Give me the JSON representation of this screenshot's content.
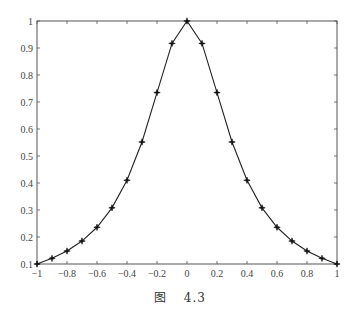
{
  "chart_data": {
    "type": "line",
    "title": "",
    "xlabel": "",
    "ylabel": "",
    "xlim": [
      -1,
      1
    ],
    "ylim": [
      0.1,
      1
    ],
    "grid": false,
    "legend": null,
    "marker": "star",
    "line_color": "#222222",
    "x_ticks": [
      -1,
      -0.8,
      -0.6,
      -0.4,
      -0.2,
      0,
      0.2,
      0.4,
      0.6,
      0.8,
      1
    ],
    "x_tick_labels": [
      "−1",
      "−0.8",
      "−0.6",
      "−0.4",
      "−0.2",
      "0",
      "0.2",
      "0.4",
      "0.6",
      "0.8",
      "1"
    ],
    "y_ticks": [
      0.1,
      0.2,
      0.3,
      0.4,
      0.5,
      0.6,
      0.7,
      0.8,
      0.9,
      1
    ],
    "y_tick_labels": [
      "0.1",
      "0.2",
      "0.3",
      "0.4",
      "0.5",
      "0.6",
      "0.7",
      "0.8",
      "0.9",
      "1"
    ],
    "series": [
      {
        "name": "f(x)",
        "x": [
          -1,
          -0.9,
          -0.8,
          -0.7,
          -0.6,
          -0.5,
          -0.4,
          -0.3,
          -0.2,
          -0.1,
          0,
          0.1,
          0.2,
          0.3,
          0.4,
          0.5,
          0.6,
          0.7,
          0.8,
          0.9,
          1
        ],
        "values": [
          0.1,
          0.121,
          0.148,
          0.185,
          0.236,
          0.308,
          0.41,
          0.552,
          0.735,
          0.917,
          1.0,
          0.917,
          0.735,
          0.552,
          0.41,
          0.308,
          0.236,
          0.185,
          0.148,
          0.121,
          0.1
        ]
      }
    ]
  },
  "caption": {
    "prefix": "图",
    "number": "4.3"
  }
}
